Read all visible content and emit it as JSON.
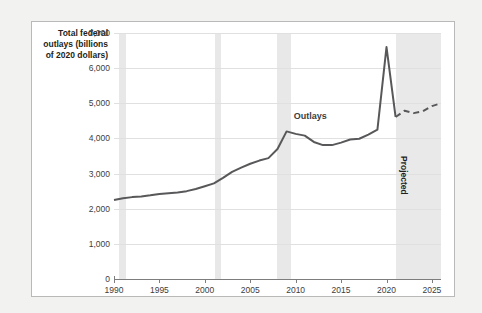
{
  "chart_data": {
    "type": "line",
    "title": "",
    "ylabel": "Total federal outlays (billions of 2020 dollars)",
    "xlabel": "",
    "ylim": [
      0,
      7000
    ],
    "xlim": [
      1990,
      2026
    ],
    "ytick_labels": [
      "0",
      "1,000",
      "2,000",
      "3,000",
      "4,000",
      "5,000",
      "6,000",
      "7,000"
    ],
    "ytick_values": [
      0,
      1000,
      2000,
      3000,
      4000,
      5000,
      6000,
      7000
    ],
    "xtick_labels": [
      "1990",
      "1995",
      "2000",
      "2005",
      "2010",
      "2015",
      "2020",
      "2025"
    ],
    "xtick_values": [
      1990,
      1995,
      2000,
      2005,
      2010,
      2015,
      2020,
      2025
    ],
    "grid": "horizontal",
    "legend": "none",
    "series": [
      {
        "name": "Outlays",
        "style": "solid",
        "color": "#58585a",
        "x": [
          1990,
          1991,
          1992,
          1993,
          1994,
          1995,
          1996,
          1997,
          1998,
          1999,
          2000,
          2001,
          2002,
          2003,
          2004,
          2005,
          2006,
          2007,
          2008,
          2009,
          2010,
          2011,
          2012,
          2013,
          2014,
          2015,
          2016,
          2017,
          2018,
          2019,
          2020,
          2021
        ],
        "values": [
          2250,
          2300,
          2330,
          2350,
          2380,
          2420,
          2440,
          2460,
          2500,
          2560,
          2640,
          2720,
          2880,
          3050,
          3170,
          3280,
          3370,
          3440,
          3700,
          4200,
          4130,
          4080,
          3900,
          3810,
          3810,
          3880,
          3970,
          3990,
          4110,
          4250,
          6600,
          4610
        ]
      },
      {
        "name": "Projected",
        "style": "dashed",
        "color": "#58585a",
        "x": [
          2021,
          2022,
          2023,
          2024,
          2025,
          2026
        ],
        "values": [
          4610,
          4790,
          4720,
          4770,
          4920,
          5000
        ]
      }
    ],
    "annotations": [
      {
        "name": "outlays-label",
        "text": "Outlays",
        "x": 2012,
        "y": 4600
      },
      {
        "name": "projected-label",
        "text": "Projected",
        "x": 2022,
        "y": 3500,
        "rotation": 90
      }
    ],
    "shaded_bands": [
      {
        "name": "recession-1990",
        "from": 1990.5,
        "to": 1991.3,
        "color": "#e8e8e8"
      },
      {
        "name": "recession-2001",
        "from": 2001.1,
        "to": 2001.8,
        "color": "#e8e8e8"
      },
      {
        "name": "recession-2008",
        "from": 2007.9,
        "to": 2009.5,
        "color": "#e8e8e8"
      },
      {
        "name": "projected-region",
        "from": 2021.0,
        "to": 2026.0,
        "color": "#e9e9e9"
      }
    ]
  }
}
